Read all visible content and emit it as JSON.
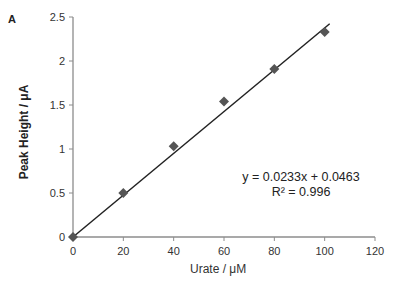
{
  "panel_label": "A",
  "chart_data": {
    "type": "scatter",
    "title": "",
    "xlabel": "Urate / μM",
    "ylabel": "Peak Height / μA",
    "xlim": [
      0,
      120
    ],
    "ylim": [
      0,
      2.5
    ],
    "xticks": [
      0,
      20,
      40,
      60,
      80,
      100,
      120
    ],
    "yticks": [
      0,
      0.5,
      1,
      1.5,
      2,
      2.5
    ],
    "ytick_labels": [
      "0",
      "0.5",
      "1",
      "1.5",
      "2",
      "2.5"
    ],
    "grid": false,
    "legend": null,
    "series": [
      {
        "name": "Peak Height",
        "marker": "diamond",
        "color": "#555555",
        "x": [
          0,
          20,
          40,
          60,
          80,
          100
        ],
        "y": [
          0,
          0.5,
          1.03,
          1.54,
          1.91,
          2.33
        ]
      }
    ],
    "trendline": {
      "type": "linear",
      "slope": 0.0233,
      "intercept": 0.0463,
      "color": "#222222",
      "x_range": [
        0,
        102
      ]
    },
    "annotations": {
      "equation": "y = 0.0233x + 0.0463",
      "r_squared": "R² = 0.996"
    }
  }
}
